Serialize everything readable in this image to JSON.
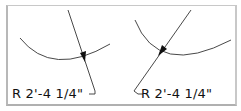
{
  "figure": {
    "panels": [
      {
        "id": "left",
        "dimension_label": "R 2'-4 1/4\"",
        "leader_style": "hook at text end (right)"
      },
      {
        "id": "right",
        "dimension_label": "R 2'-4 1/4\"",
        "leader_style": "hook at text start (left)"
      }
    ],
    "colors": {
      "line": "#222222",
      "frame": "#c0c0c0",
      "background": "#ffffff"
    }
  }
}
